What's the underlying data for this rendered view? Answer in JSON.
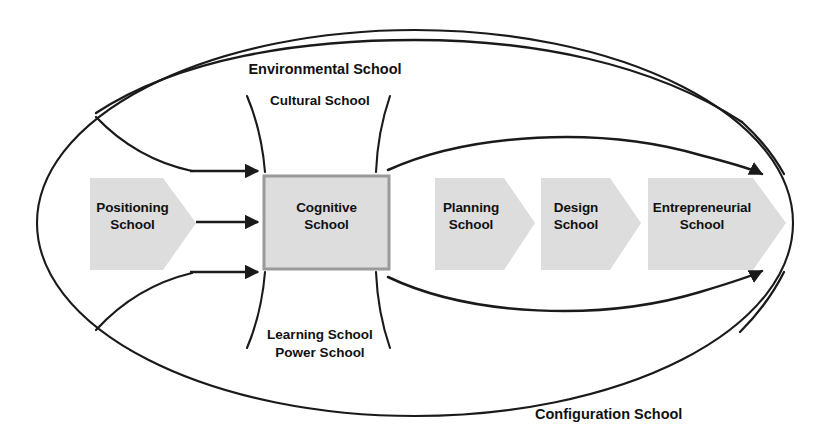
{
  "diagram": {
    "type": "conceptual-process-diagram",
    "colors": {
      "shape_fill": "#dddddd",
      "shape_border": "#9a9a9a",
      "line": "#1a1a1a",
      "text": "#111111",
      "background": "#ffffff"
    },
    "outer_ellipse": {
      "label": "Configuration School",
      "label_position": "bottom-right"
    },
    "mid_ellipse": {
      "label": "Environmental School",
      "label_position": "top-center"
    },
    "inner_ellipse": {
      "labels_top": "Cultural School",
      "labels_bottom": "Learning School\nPower School"
    },
    "nodes": [
      {
        "id": "positioning",
        "label": "Positioning\nSchool",
        "shape": "chevron",
        "fill": "#dddddd",
        "bordered": false
      },
      {
        "id": "cognitive",
        "label": "Cognitive\nSchool",
        "shape": "rectangle",
        "fill": "#dddddd",
        "bordered": true
      },
      {
        "id": "planning",
        "label": "Planning\nSchool",
        "shape": "chevron",
        "fill": "#dddddd",
        "bordered": false
      },
      {
        "id": "design",
        "label": "Design\nSchool",
        "shape": "chevron",
        "fill": "#dddddd",
        "bordered": false
      },
      {
        "id": "entrepreneurial",
        "label": "Entrepreneurial\nSchool",
        "shape": "chevron",
        "fill": "#dddddd",
        "bordered": false
      }
    ],
    "arrows": [
      {
        "id": "arrow-top-into-cognitive",
        "from": "outer-upper-left",
        "to": "cognitive",
        "direction": "right"
      },
      {
        "id": "arrow-mid-into-cognitive",
        "from": "positioning",
        "to": "cognitive",
        "direction": "right"
      },
      {
        "id": "arrow-bottom-into-cognitive",
        "from": "outer-lower-left",
        "to": "cognitive",
        "direction": "right"
      },
      {
        "id": "arrow-upper-sweep-right",
        "from": "cognitive",
        "to": "outer-right",
        "direction": "down-right"
      },
      {
        "id": "arrow-lower-sweep-right",
        "from": "cognitive",
        "to": "outer-right",
        "direction": "up-right"
      }
    ]
  }
}
